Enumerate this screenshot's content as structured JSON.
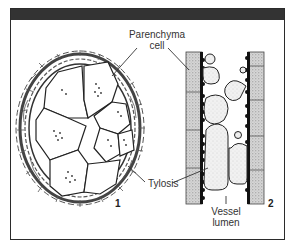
{
  "figure": {
    "header_bar_color": "#333333",
    "labels": {
      "parenchyma_line1": "Parenchyma",
      "parenchyma_line2": "cell",
      "tylosis": "Tylosis",
      "vessel_line1": "Vessel",
      "vessel_line2": "lumen"
    },
    "panel_numbers": {
      "left": "1",
      "right": "2"
    }
  }
}
